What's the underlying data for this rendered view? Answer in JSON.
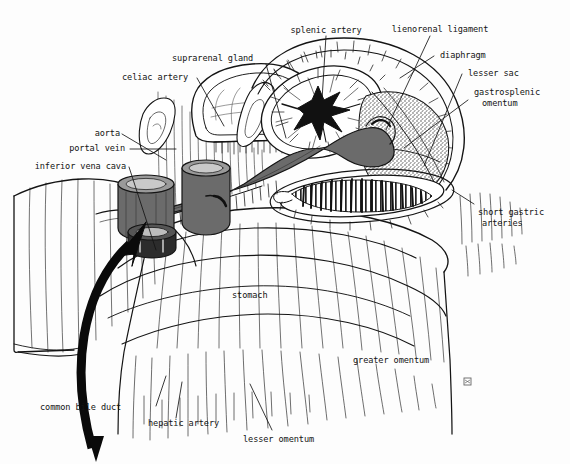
{
  "figure": {
    "kind": "anatomical-line-drawing",
    "signature": "Y.B.",
    "background_color": "#fdfdfd",
    "ink_color": "#141414",
    "vessel_fill": "#6b6b6b",
    "stipple_fill": "#9a9a9a"
  },
  "labels": [
    {
      "id": "splenic-artery",
      "text": "splenic artery",
      "lines": [
        "splenic artery"
      ]
    },
    {
      "id": "lienorenal-ligament",
      "text": "lienorenal ligament",
      "lines": [
        "lienorenal ligament"
      ]
    },
    {
      "id": "diaphragm",
      "text": "diaphragm",
      "lines": [
        "diaphragm"
      ]
    },
    {
      "id": "lesser-sac",
      "text": "lesser sac",
      "lines": [
        "lesser sac"
      ]
    },
    {
      "id": "gastrosplenic-omentum",
      "text": "gastrosplenic omentum",
      "lines": [
        "gastrosplenic",
        "omentum"
      ]
    },
    {
      "id": "suprarenal-gland",
      "text": "suprarenal gland",
      "lines": [
        "suprarenal gland"
      ]
    },
    {
      "id": "celiac-artery",
      "text": "celiac artery",
      "lines": [
        "celiac artery"
      ]
    },
    {
      "id": "aorta",
      "text": "aorta",
      "lines": [
        "aorta"
      ]
    },
    {
      "id": "portal-vein",
      "text": "portal vein",
      "lines": [
        "portal vein"
      ]
    },
    {
      "id": "inferior-vena-cava",
      "text": "inferior vena cava",
      "lines": [
        "inferior vena cava"
      ]
    },
    {
      "id": "short-gastric-arteries",
      "text": "short gastric arteries",
      "lines": [
        "short gastric",
        "arteries"
      ]
    },
    {
      "id": "stomach",
      "text": "stomach",
      "lines": [
        "stomach"
      ]
    },
    {
      "id": "greater-omentum",
      "text": "greater omentum",
      "lines": [
        "greater omentum"
      ]
    },
    {
      "id": "common-bile-duct",
      "text": "common bile duct",
      "lines": [
        "common bile duct"
      ]
    },
    {
      "id": "hepatic-artery",
      "text": "hepatic artery",
      "lines": [
        "hepatic artery"
      ]
    },
    {
      "id": "lesser-omentum",
      "text": "lesser omentum",
      "lines": [
        "lesser omentum"
      ]
    }
  ],
  "label_text": {
    "splenic_artery": "splenic artery",
    "lienorenal_ligament": "lienorenal ligament",
    "diaphragm": "diaphragm",
    "lesser_sac": "lesser sac",
    "gastrosplenic_1": "gastrosplenic",
    "gastrosplenic_2": "omentum",
    "suprarenal_gland": "suprarenal gland",
    "celiac_artery": "celiac artery",
    "aorta": "aorta",
    "portal_vein": "portal vein",
    "inferior_vena_cava": "inferior vena cava",
    "short_gastric_1": "short gastric",
    "short_gastric_2": "arteries",
    "stomach": "stomach",
    "greater_omentum": "greater omentum",
    "common_bile_duct": "common bile duct",
    "hepatic_artery": "hepatic artery",
    "lesser_omentum": "lesser omentum"
  }
}
